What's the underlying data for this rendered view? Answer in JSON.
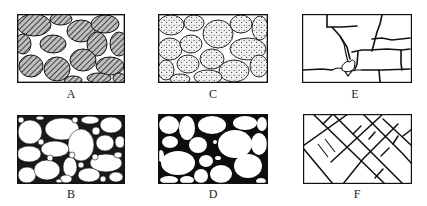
{
  "figure": {
    "panels": [
      {
        "id": "A",
        "label": "A",
        "texture": "hatched-grains",
        "description": "Densely packed hatched grains with small white pore spaces"
      },
      {
        "id": "C",
        "label": "C",
        "texture": "stippled-grains",
        "description": "Stippled (dotted) grains with thin intergranular pores"
      },
      {
        "id": "E",
        "label": "E",
        "texture": "fractured-blocks",
        "description": "Blocky matrix with fractures and dissolution-enlarged joints"
      },
      {
        "id": "B",
        "label": "B",
        "texture": "white-grains-dark-matrix",
        "description": "White rounded grains of varied size in dark matrix with small pores"
      },
      {
        "id": "D",
        "label": "D",
        "texture": "white-grains-black-matrix",
        "description": "Large white rounded grains in black matrix"
      },
      {
        "id": "F",
        "label": "F",
        "texture": "cross-fractures",
        "description": "Intersecting diagonal fracture network"
      }
    ],
    "colors": {
      "ink": "#1a1a1a",
      "background": "#ffffff"
    }
  }
}
